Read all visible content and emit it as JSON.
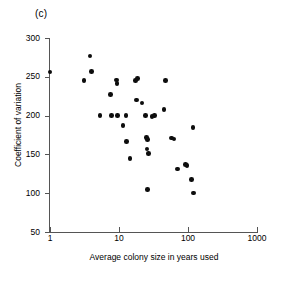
{
  "figure": {
    "panel_label": "(c)",
    "marker_color": "#0d0d0d",
    "axis_color": "#555555"
  },
  "chart_data": {
    "type": "scatter",
    "title": "(c)",
    "xlabel": "Average colony size in years used",
    "ylabel": "Coefficient of variation",
    "xscale": "log",
    "yscale": "linear",
    "xlim": [
      1,
      1000
    ],
    "ylim": [
      50,
      300
    ],
    "xticks": [
      1,
      10,
      100,
      1000
    ],
    "xtick_labels": [
      "1",
      "10",
      "100",
      "1000"
    ],
    "yticks": [
      50,
      100,
      150,
      200,
      250,
      300
    ],
    "ytick_labels": [
      "50",
      "100",
      "150",
      "200",
      "250",
      "300"
    ],
    "grid": false,
    "legend": null,
    "n_points": 36,
    "points": [
      {
        "x": 1.0,
        "y": 256
      },
      {
        "x": 3.1,
        "y": 245
      },
      {
        "x": 3.8,
        "y": 277
      },
      {
        "x": 4.0,
        "y": 257
      },
      {
        "x": 5.3,
        "y": 200
      },
      {
        "x": 7.6,
        "y": 227
      },
      {
        "x": 7.8,
        "y": 200
      },
      {
        "x": 9.2,
        "y": 246
      },
      {
        "x": 9.3,
        "y": 241
      },
      {
        "x": 9.5,
        "y": 200
      },
      {
        "x": 11.5,
        "y": 187
      },
      {
        "x": 12.6,
        "y": 200
      },
      {
        "x": 12.8,
        "y": 167
      },
      {
        "x": 14.5,
        "y": 145
      },
      {
        "x": 17.5,
        "y": 245
      },
      {
        "x": 18.5,
        "y": 248
      },
      {
        "x": 18.0,
        "y": 220
      },
      {
        "x": 21.5,
        "y": 216
      },
      {
        "x": 24.0,
        "y": 200
      },
      {
        "x": 25.0,
        "y": 172
      },
      {
        "x": 26.0,
        "y": 169
      },
      {
        "x": 25.5,
        "y": 157
      },
      {
        "x": 26.5,
        "y": 151
      },
      {
        "x": 26.0,
        "y": 105
      },
      {
        "x": 30.0,
        "y": 199
      },
      {
        "x": 33.0,
        "y": 200
      },
      {
        "x": 45.0,
        "y": 208
      },
      {
        "x": 47.0,
        "y": 245
      },
      {
        "x": 58.0,
        "y": 171
      },
      {
        "x": 63.0,
        "y": 170
      },
      {
        "x": 70.0,
        "y": 131
      },
      {
        "x": 92.0,
        "y": 137
      },
      {
        "x": 97.0,
        "y": 136
      },
      {
        "x": 112.0,
        "y": 118
      },
      {
        "x": 118.0,
        "y": 185
      },
      {
        "x": 120.0,
        "y": 100
      }
    ]
  }
}
